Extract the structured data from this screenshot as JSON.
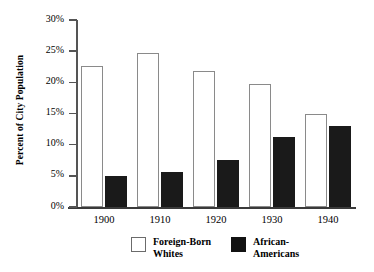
{
  "chart_data": {
    "type": "bar",
    "title": "",
    "xlabel": "",
    "ylabel": "Percent of City Population",
    "categories": [
      "1900",
      "1910",
      "1920",
      "1930",
      "1940"
    ],
    "ylim": [
      0,
      30
    ],
    "ytick_labels": [
      "0%",
      "5%",
      "10%",
      "15%",
      "20%",
      "25%",
      "30%"
    ],
    "ytick_values": [
      0,
      5,
      10,
      15,
      20,
      25,
      30
    ],
    "grid": false,
    "legend_position": "bottom",
    "series": [
      {
        "name": "Foreign-Born Whites",
        "name_line1": "Foreign-Born",
        "name_line2": "Whites",
        "color": "#ffffff",
        "edge_color": "#8a8a8a",
        "values": [
          22.7,
          24.7,
          21.8,
          19.7,
          15.0
        ]
      },
      {
        "name": "African-Americans",
        "name_line1": "African-",
        "name_line2": "Americans",
        "color": "#1a1a1a",
        "edge_color": "#1a1a1a",
        "values": [
          5.0,
          5.6,
          7.5,
          11.3,
          13.0
        ]
      }
    ]
  },
  "axes": {
    "y_title": "Percent of City Population"
  }
}
